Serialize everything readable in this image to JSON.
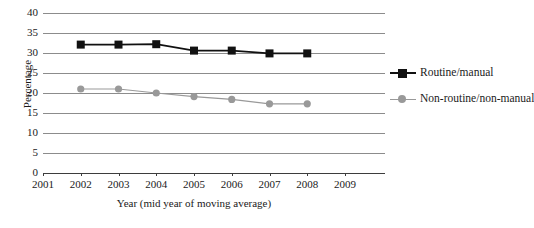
{
  "chart_data": {
    "type": "line",
    "title": "",
    "xlabel": "Year (mid year of moving average)",
    "ylabel": "Percentage",
    "x": [
      2001,
      2002,
      2003,
      2004,
      2005,
      2006,
      2007,
      2008,
      2009
    ],
    "xtick_labels": [
      "2001",
      "2002",
      "2003",
      "2004",
      "2005",
      "2006",
      "2007",
      "2008",
      "2009"
    ],
    "ytick_labels": [
      "0",
      "5",
      "10",
      "15",
      "20",
      "25",
      "30",
      "35",
      "40"
    ],
    "ytick_values": [
      0,
      5,
      10,
      15,
      20,
      25,
      30,
      35,
      40
    ],
    "ylim": [
      0,
      40
    ],
    "xlim": [
      2001,
      2009
    ],
    "grid": "horizontal",
    "legend_position": "right",
    "series": [
      {
        "name": "Routine/manual",
        "color": "#111111",
        "marker": "square",
        "x": [
          2002,
          2003,
          2004,
          2005,
          2006,
          2007,
          2008
        ],
        "values": [
          32.1,
          32.1,
          32.2,
          30.6,
          30.6,
          29.9,
          29.9
        ]
      },
      {
        "name": "Non-routine/non-manual",
        "color": "#999999",
        "marker": "circle",
        "x": [
          2002,
          2003,
          2004,
          2005,
          2006,
          2007,
          2008
        ],
        "values": [
          21.0,
          21.0,
          20.0,
          19.1,
          18.4,
          17.3,
          17.3
        ]
      }
    ]
  },
  "legend": {
    "items": [
      {
        "label": "Routine/manual"
      },
      {
        "label": "Non-routine/non-manual"
      }
    ]
  }
}
